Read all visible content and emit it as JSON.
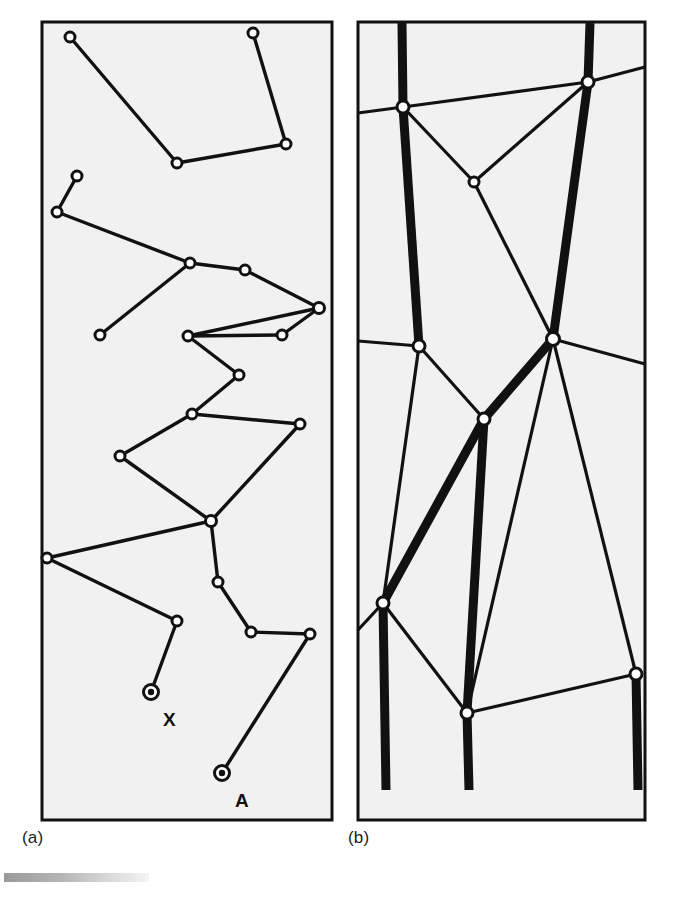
{
  "figure": {
    "type": "diagram",
    "background_color": "#ffffff",
    "panel_fill": "#f1f1f1",
    "stroke_color": "#111111",
    "captions": {
      "a": "(a)",
      "b": "(b)"
    },
    "panels": [
      {
        "id": "panel-a",
        "caption": "(a)",
        "frame": {
          "x": 42,
          "y": 22,
          "width": 290,
          "height": 798
        },
        "node_style": "open-circle",
        "nodes": [
          {
            "id": "a1",
            "x": 70,
            "y": 37,
            "label": ""
          },
          {
            "id": "a2",
            "x": 253,
            "y": 33,
            "label": ""
          },
          {
            "id": "a3",
            "x": 177,
            "y": 163,
            "label": ""
          },
          {
            "id": "a4",
            "x": 286,
            "y": 144,
            "label": ""
          },
          {
            "id": "a5",
            "x": 77,
            "y": 176,
            "label": ""
          },
          {
            "id": "a6",
            "x": 57,
            "y": 212,
            "label": ""
          },
          {
            "id": "a7",
            "x": 190,
            "y": 263,
            "label": ""
          },
          {
            "id": "a8",
            "x": 245,
            "y": 270,
            "label": ""
          },
          {
            "id": "a9",
            "x": 319,
            "y": 308,
            "label": ""
          },
          {
            "id": "a10",
            "x": 100,
            "y": 335,
            "label": ""
          },
          {
            "id": "a11",
            "x": 188,
            "y": 336,
            "label": ""
          },
          {
            "id": "a12",
            "x": 282,
            "y": 335,
            "label": ""
          },
          {
            "id": "a13",
            "x": 239,
            "y": 375,
            "label": ""
          },
          {
            "id": "a14",
            "x": 192,
            "y": 414,
            "label": ""
          },
          {
            "id": "a15",
            "x": 300,
            "y": 424,
            "label": ""
          },
          {
            "id": "a16",
            "x": 120,
            "y": 456,
            "label": ""
          },
          {
            "id": "a17",
            "x": 211,
            "y": 521,
            "label": ""
          },
          {
            "id": "a18",
            "x": 47,
            "y": 558,
            "label": ""
          },
          {
            "id": "a19",
            "x": 218,
            "y": 582,
            "label": ""
          },
          {
            "id": "a20",
            "x": 177,
            "y": 621,
            "label": ""
          },
          {
            "id": "a21",
            "x": 251,
            "y": 632,
            "label": ""
          },
          {
            "id": "a22",
            "x": 310,
            "y": 634,
            "label": ""
          }
        ],
        "terminals": [
          {
            "id": "X",
            "x": 151,
            "y": 692,
            "label": "X",
            "label_x": 163,
            "label_y": 718
          },
          {
            "id": "A",
            "x": 222,
            "y": 773,
            "label": "A",
            "label_x": 234,
            "label_y": 798
          }
        ],
        "edges": [
          [
            "a1",
            "a3"
          ],
          [
            "a3",
            "a4"
          ],
          [
            "a4",
            "a2"
          ],
          [
            "a5",
            "a6"
          ],
          [
            "a6",
            "a7"
          ],
          [
            "a7",
            "a8"
          ],
          [
            "a8",
            "a9"
          ],
          [
            "a7",
            "a10"
          ],
          [
            "a9",
            "a11"
          ],
          [
            "a11",
            "a12"
          ],
          [
            "a12",
            "a9"
          ],
          [
            "a11",
            "a13"
          ],
          [
            "a13",
            "a14"
          ],
          [
            "a14",
            "a15"
          ],
          [
            "a14",
            "a16"
          ],
          [
            "a16",
            "a17"
          ],
          [
            "a15",
            "a17"
          ],
          [
            "a17",
            "a18"
          ],
          [
            "a18",
            "a20"
          ],
          [
            "a17",
            "a19"
          ],
          [
            "a19",
            "a21"
          ],
          [
            "a21",
            "a22"
          ],
          [
            "a20",
            "X"
          ],
          [
            "a22",
            "A"
          ]
        ],
        "line_width": 3.2
      },
      {
        "id": "panel-b",
        "caption": "(b)",
        "frame": {
          "x": 358,
          "y": 22,
          "width": 287,
          "height": 798
        },
        "node_style": "open-circle",
        "nodes": [
          {
            "id": "b1",
            "x": 403,
            "y": 107
          },
          {
            "id": "b2",
            "x": 588,
            "y": 82
          },
          {
            "id": "b3",
            "x": 474,
            "y": 182
          },
          {
            "id": "b4",
            "x": 553,
            "y": 339
          },
          {
            "id": "b5",
            "x": 419,
            "y": 346
          },
          {
            "id": "b6",
            "x": 484,
            "y": 419
          },
          {
            "id": "b7",
            "x": 383,
            "y": 603
          },
          {
            "id": "b8",
            "x": 467,
            "y": 713
          },
          {
            "id": "b9",
            "x": 636,
            "y": 674
          }
        ],
        "thick_edges": [
          [
            "top-edge-1",
            "b1"
          ],
          [
            "top-edge-2",
            "b2"
          ],
          [
            "b1",
            "b5"
          ],
          [
            "b2",
            "b4"
          ],
          [
            "b4",
            "b6"
          ],
          [
            "b6",
            "b7"
          ],
          [
            "b7",
            "bottom-1"
          ],
          [
            "b6",
            "b8"
          ],
          [
            "b8",
            "bottom-2"
          ],
          [
            "b9",
            "bottom-3"
          ]
        ],
        "thin_edges": [
          [
            "left-edge-1",
            "b1"
          ],
          [
            "b1",
            "b2"
          ],
          [
            "b2",
            "right-edge-1"
          ],
          [
            "b1",
            "b3"
          ],
          [
            "b3",
            "b2"
          ],
          [
            "b3",
            "b6"
          ],
          [
            "left-edge-2",
            "b5"
          ],
          [
            "b5",
            "b6"
          ],
          [
            "b4",
            "right-edge-2"
          ],
          [
            "b4",
            "b8"
          ],
          [
            "b4",
            "b9"
          ],
          [
            "b5",
            "b7"
          ],
          [
            "left-edge-3",
            "b7"
          ],
          [
            "b7",
            "b8"
          ],
          [
            "b8",
            "b9"
          ]
        ],
        "thick_line_width": 9,
        "thin_line_width": 3.2
      }
    ]
  }
}
